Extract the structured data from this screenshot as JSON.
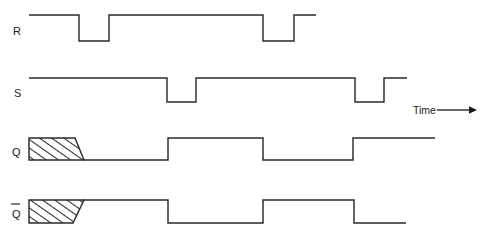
{
  "figure": {
    "background_color": "#ffffff",
    "line_color": "#2b2b2b",
    "text_color": "#1a1a1a",
    "width": 487,
    "height": 236
  },
  "annotations": {
    "time_label": "Time",
    "time_arrow": "right-arrow"
  },
  "signals": [
    {
      "key": "R",
      "label": "R",
      "label_overbar": false,
      "label_x": 13,
      "label_y": 35,
      "high_y": 15,
      "low_y": 41,
      "start_x": 29,
      "end_x": 316,
      "initial_level": "high",
      "indeterminate": false,
      "transitions": [
        79,
        109,
        263,
        294
      ],
      "points": "29,15 79,15 79,41 109,41 109,15 263,15 263,41 294,41 294,15 316,15"
    },
    {
      "key": "S",
      "label": "S",
      "label_overbar": false,
      "label_x": 14,
      "label_y": 97,
      "high_y": 78,
      "low_y": 102,
      "start_x": 29,
      "end_x": 407,
      "initial_level": "high",
      "indeterminate": false,
      "transitions": [
        167,
        196,
        355,
        384
      ],
      "points": "29,78 167,78 167,102 196,102 196,78 355,78 355,102 384,102 384,78 407,78"
    },
    {
      "key": "Q",
      "label": "Q",
      "label_overbar": false,
      "label_x": 12,
      "label_y": 156,
      "high_y": 138,
      "low_y": 160,
      "start_x": 29,
      "end_x": 435,
      "initial_level": "indeterminate",
      "indeterminate": true,
      "indeterminate_region": {
        "x_start": 29,
        "x_top_end": 75,
        "x_bottom_end": 84,
        "resolves_to": "low"
      },
      "transitions": [
        168,
        263,
        353
      ],
      "points": "84,160 168,160 168,138 263,138 263,160 353,160 353,138 435,138"
    },
    {
      "key": "Qbar",
      "label": "Q",
      "label_overbar": true,
      "label_x": 12,
      "label_y": 218,
      "high_y": 200,
      "low_y": 223,
      "start_x": 29,
      "end_x": 406,
      "initial_level": "indeterminate",
      "indeterminate": true,
      "indeterminate_region": {
        "x_start": 29,
        "x_top_end": 84,
        "x_bottom_end": 73,
        "resolves_to": "high"
      },
      "transitions": [
        168,
        263,
        354
      ],
      "points": "84,200 168,200 168,223 263,223 263,200 354,200 354,223 406,223"
    }
  ],
  "chart_data": {
    "type": "line",
    "xlabel": "Time",
    "ylabel": "",
    "grid": false,
    "legend": "none",
    "series": [
      {
        "name": "R",
        "levels": [
          "high",
          "low",
          "high",
          "low",
          "high"
        ],
        "edge_x": [
          79,
          109,
          263,
          294
        ],
        "start_x": 29,
        "end_x": 316
      },
      {
        "name": "S",
        "levels": [
          "high",
          "low",
          "high",
          "low",
          "high"
        ],
        "edge_x": [
          167,
          196,
          355,
          384
        ],
        "start_x": 29,
        "end_x": 407
      },
      {
        "name": "Q",
        "levels": [
          "indeterminate",
          "low",
          "high",
          "low",
          "high"
        ],
        "edge_x": [
          84,
          168,
          263,
          353
        ],
        "start_x": 29,
        "end_x": 435
      },
      {
        "name": "Q-bar",
        "levels": [
          "indeterminate",
          "high",
          "low",
          "high",
          "low"
        ],
        "edge_x": [
          84,
          168,
          263,
          354
        ],
        "start_x": 29,
        "end_x": 406
      }
    ]
  }
}
